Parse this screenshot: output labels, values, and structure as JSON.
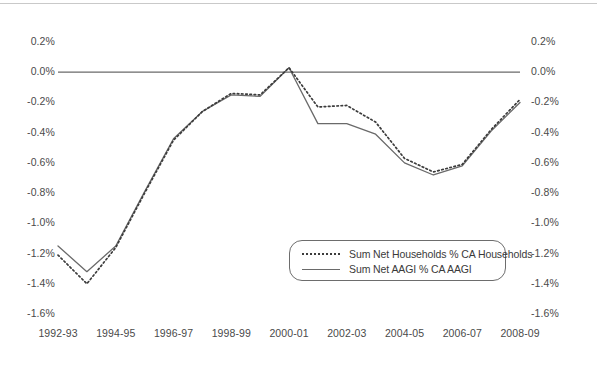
{
  "chart_data": {
    "type": "line",
    "title": "",
    "subtitle": "",
    "xlabel": "",
    "ylabel": "",
    "ylim": [
      -1.6,
      0.2
    ],
    "ytick_labels": [
      "0.2%",
      "0.0%",
      "-0.2%",
      "-0.4%",
      "-0.6%",
      "-0.8%",
      "-1.0%",
      "-1.2%",
      "-1.4%",
      "-1.6%"
    ],
    "ytick_values": [
      0.2,
      0.0,
      -0.2,
      -0.4,
      -0.6,
      -0.8,
      -1.0,
      -1.2,
      -1.4,
      -1.6
    ],
    "dual_axis": true,
    "right_axis_mirrors_left": true,
    "grid": false,
    "zero_line": true,
    "legend_position": "inside-bottom-right",
    "x": [
      "1992-93",
      "1993-94",
      "1994-95",
      "1995-96",
      "1996-97",
      "1997-98",
      "1998-99",
      "1999-00",
      "2000-01",
      "2001-02",
      "2002-03",
      "2003-04",
      "2004-05",
      "2005-06",
      "2006-07",
      "2007-08",
      "2008-09"
    ],
    "xtick_labels": [
      "1992-93",
      "1994-95",
      "1996-97",
      "1998-99",
      "2000-01",
      "2002-03",
      "2004-05",
      "2006-07",
      "2008-09"
    ],
    "series": [
      {
        "name": "Sum Net Households % CA Households",
        "style": "dotted",
        "color": "#3c3c3c",
        "values": [
          -1.21,
          -1.4,
          -1.16,
          -0.8,
          -0.45,
          -0.26,
          -0.14,
          -0.15,
          0.03,
          -0.23,
          -0.22,
          -0.33,
          -0.57,
          -0.66,
          -0.61,
          -0.38,
          -0.18
        ]
      },
      {
        "name": "Sum Net AAGI % CA AAGI",
        "style": "solid",
        "color": "#6a6a6a",
        "values": [
          -1.15,
          -1.32,
          -1.15,
          -0.79,
          -0.44,
          -0.26,
          -0.15,
          -0.16,
          0.03,
          -0.34,
          -0.34,
          -0.41,
          -0.6,
          -0.68,
          -0.62,
          -0.39,
          -0.2
        ]
      }
    ]
  },
  "axes": {
    "left_labels": [
      "0.2%",
      "0.0%",
      "-0.2%",
      "-0.4%",
      "-0.6%",
      "-0.8%",
      "-1.0%",
      "-1.2%",
      "-1.4%",
      "-1.6%"
    ],
    "right_labels": [
      "0.2%",
      "0.0%",
      "-0.2%",
      "-0.4%",
      "-0.6%",
      "-0.8%",
      "-1.0%",
      "-1.2%",
      "-1.4%",
      "-1.6%"
    ],
    "bottom_labels": [
      "1992-93",
      "1994-95",
      "1996-97",
      "1998-99",
      "2000-01",
      "2002-03",
      "2004-05",
      "2006-07",
      "2008-09"
    ]
  },
  "legend": {
    "entries": [
      {
        "label": "Sum Net Households % CA Households",
        "style": "dotted"
      },
      {
        "label": "Sum Net AAGI % CA AAGI",
        "style": "solid"
      }
    ]
  },
  "colors": {
    "households_series": "#3c3c3c",
    "aagi_series": "#6a6a6a",
    "axis_text": "#4a4a4a",
    "background": "#ffffff"
  }
}
